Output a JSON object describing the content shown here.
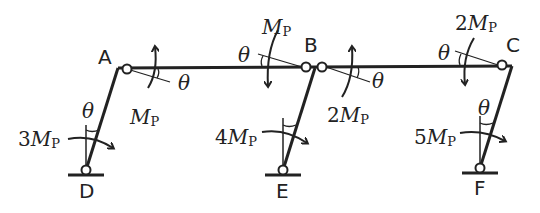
{
  "diagram": {
    "type": "plastic collapse mechanism (sway) of a three-bay portal frame",
    "nodes": {
      "A": "A",
      "B": "B",
      "C": "C",
      "D": "D",
      "E": "E",
      "F": "F"
    },
    "rotation_symbol": "θ",
    "moment_symbol": "M",
    "moment_subscript": "P",
    "moments": {
      "A_beam": {
        "coef": "",
        "label": "M"
      },
      "B_left": {
        "coef": "",
        "label": "M"
      },
      "B_right": {
        "coef": "2",
        "label": "2M"
      },
      "C_beam": {
        "coef": "2",
        "label": "2M"
      },
      "D_col": {
        "coef": "3",
        "label": "3M"
      },
      "E_col": {
        "coef": "4",
        "label": "4M"
      },
      "F_col": {
        "coef": "5",
        "label": "5M"
      }
    }
  }
}
